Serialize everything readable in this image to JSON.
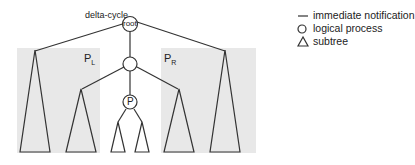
{
  "diagram": {
    "title_label": "delta-cycle",
    "root_label": "root",
    "process_label": "P",
    "partition_left": {
      "main": "P",
      "sub": "L"
    },
    "partition_right": {
      "main": "P",
      "sub": "R"
    },
    "colors": {
      "partition_fill": "#e8e8e8",
      "stroke": "#333333"
    }
  },
  "legend": {
    "items": [
      {
        "symbol": "line",
        "label": "immediate notification"
      },
      {
        "symbol": "circle",
        "label": "logical process"
      },
      {
        "symbol": "triangle",
        "label": "subtree"
      }
    ]
  }
}
